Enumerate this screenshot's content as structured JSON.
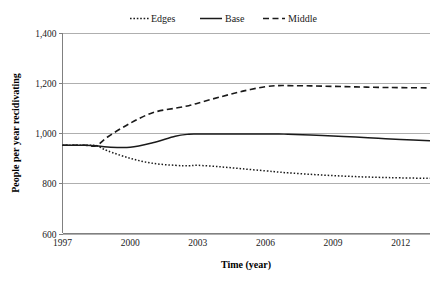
{
  "chart_data": {
    "type": "line",
    "title": "",
    "xlabel": "Time (year)",
    "ylabel": "People per year recidivating",
    "xlim": [
      1997,
      2013.3
    ],
    "ylim": [
      600,
      1400
    ],
    "grid": true,
    "legend_position": "top-center",
    "xticks": [
      1997,
      2000,
      2003,
      2006,
      2009,
      2012
    ],
    "xtick_labels": [
      "1997",
      "2000",
      "2003",
      "2006",
      "2009",
      "2012"
    ],
    "yticks": [
      600,
      800,
      1000,
      1200,
      1400
    ],
    "ytick_labels": [
      "600",
      "800",
      "1,000",
      "1,200",
      "1,400"
    ],
    "x": [
      1997,
      1998,
      1998.5,
      1999,
      2000,
      2001,
      2002,
      2002.6,
      2003,
      2004,
      2005,
      2006,
      2006.6,
      2007,
      2008,
      2009,
      2010,
      2011,
      2012,
      2013.3
    ],
    "series": [
      {
        "name": "Edges",
        "style": "dotted",
        "color": "#1a1a1a",
        "values": [
          952,
          952,
          950,
          930,
          900,
          880,
          872,
          870,
          872,
          866,
          858,
          850,
          845,
          842,
          836,
          831,
          827,
          824,
          822,
          820
        ]
      },
      {
        "name": "Base",
        "style": "solid",
        "color": "#1a1a1a",
        "values": [
          952,
          952,
          950,
          945,
          944,
          962,
          988,
          996,
          997,
          997,
          997,
          997,
          997,
          996,
          993,
          989,
          985,
          980,
          975,
          970
        ]
      },
      {
        "name": "Middle",
        "style": "dashed",
        "color": "#1a1a1a",
        "values": [
          952,
          952,
          950,
          985,
          1040,
          1082,
          1100,
          1110,
          1120,
          1145,
          1168,
          1186,
          1190,
          1190,
          1189,
          1187,
          1185,
          1183,
          1182,
          1181
        ]
      }
    ]
  },
  "legend": {
    "items": [
      {
        "label": "Edges",
        "style": "dotted"
      },
      {
        "label": "Base",
        "style": "solid"
      },
      {
        "label": "Middle",
        "style": "dashed"
      }
    ]
  }
}
